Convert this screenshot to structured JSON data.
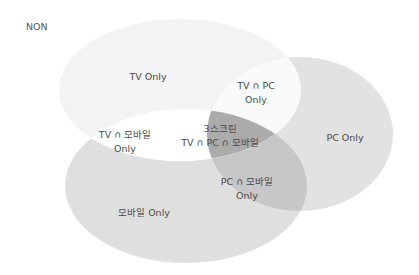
{
  "diagram": {
    "type": "venn",
    "outside_label": "NON",
    "sets": [
      {
        "id": "tv",
        "name": "TV",
        "color": "#f3f3f3"
      },
      {
        "id": "pc",
        "name": "PC",
        "color": "#e2e2e2"
      },
      {
        "id": "mobile",
        "name": "모바일",
        "color": "#dfdfdf"
      }
    ],
    "region_colors": {
      "tv_only": "#f3f3f3",
      "pc_only": "#e2e2e2",
      "mobile_only": "#dfdfdf",
      "tv_pc": "#fafafa",
      "tv_mobile": "#ffffff",
      "pc_mobile": "#c7c7c7",
      "all_three": "#ababab"
    },
    "regions": {
      "tv_only": {
        "line1": "TV Only"
      },
      "tv_pc": {
        "line1": "TV ∩ PC",
        "line2": "Only"
      },
      "pc_only": {
        "line1": "PC Only"
      },
      "tv_mobile": {
        "line1": "TV ∩ 모바일",
        "line2": "Only"
      },
      "all_three": {
        "line1": "3스크린",
        "line2": "TV ∩ PC ∩ 모바일"
      },
      "pc_mobile": {
        "line1": "PC ∩ 모바일",
        "line2": "Only"
      },
      "mobile_only": {
        "line1": "모바일 Only"
      }
    }
  }
}
